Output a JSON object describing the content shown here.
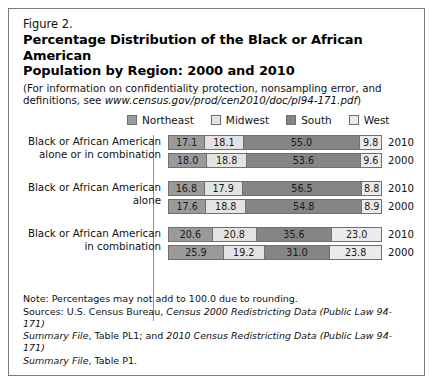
{
  "figure": {
    "number": "Figure 2.",
    "title_line1": "Percentage Distribution of the Black or African American",
    "title_line2": "Population by Region: 2000 and 2010",
    "subtitle_line1": "(For information on confidentiality protection, nonsampling error, and",
    "subtitle_line2_prefix": "definitions, see ",
    "subtitle_url": "www.census.gov/prod/cen2010/doc/pl94-171.pdf",
    "subtitle_line2_suffix": ")"
  },
  "legend": {
    "items": [
      {
        "label": "Northeast",
        "color": "#9a9a9a"
      },
      {
        "label": "Midwest",
        "color": "#e3e3e3"
      },
      {
        "label": "South",
        "color": "#858585"
      },
      {
        "label": "West",
        "color": "#ebebeb"
      }
    ]
  },
  "groups": [
    {
      "label_line1": "Black or African American",
      "label_line2": "alone or in combination",
      "rows": [
        {
          "year": "2010",
          "values": [
            "17.1",
            "18.1",
            "55.0",
            "9.8"
          ]
        },
        {
          "year": "2000",
          "values": [
            "18.0",
            "18.8",
            "53.6",
            "9.6"
          ]
        }
      ]
    },
    {
      "label_line1": "Black or African American",
      "label_line2": "alone",
      "rows": [
        {
          "year": "2010",
          "values": [
            "16.8",
            "17.9",
            "56.5",
            "8.8"
          ]
        },
        {
          "year": "2000",
          "values": [
            "17.6",
            "18.8",
            "54.8",
            "8.9"
          ]
        }
      ]
    },
    {
      "label_line1": "Black or African American",
      "label_line2": "in combination",
      "rows": [
        {
          "year": "2010",
          "values": [
            "20.6",
            "20.8",
            "35.6",
            "23.0"
          ]
        },
        {
          "year": "2000",
          "values": [
            "25.9",
            "19.2",
            "31.0",
            "23.8"
          ]
        }
      ]
    }
  ],
  "footer": {
    "note": "Note: Percentages may not add to 100.0 due to rounding.",
    "sources_prefix": "Sources: U.S. Census Bureau, ",
    "sources_ital1": "Census 2000 Redistricting Data (Public Law 94-171)",
    "sources_ital2": "Summary File",
    "sources_mid": ", Table PL1; and ",
    "sources_ital3": "2010 Census Redistricting Data (Public Law 94-171)",
    "sources_ital4": "Summary File",
    "sources_end": ", Table P1."
  },
  "chart_data": {
    "type": "bar",
    "title": "Percentage Distribution of the Black or African American Population by Region: 2000 and 2010",
    "subtitle": "(For information on confidentiality protection, nonsampling error, and definitions, see www.census.gov/prod/cen2010/doc/pl94-171.pdf)",
    "orientation": "horizontal",
    "stacked": true,
    "stacked_normalized": true,
    "xlabel": "",
    "ylabel": "",
    "xlim": [
      0,
      100
    ],
    "grid": false,
    "legend_position": "top-center",
    "legend": [
      "Northeast",
      "Midwest",
      "South",
      "West"
    ],
    "categories": [
      "Black or African American alone or in combination, 2010",
      "Black or African American alone or in combination, 2000",
      "Black or African American alone, 2010",
      "Black or African American alone, 2000",
      "Black or African American in combination, 2010",
      "Black or African American in combination, 2000"
    ],
    "series": [
      {
        "name": "Northeast",
        "values": [
          17.1,
          18.0,
          16.8,
          17.6,
          20.6,
          25.9
        ]
      },
      {
        "name": "Midwest",
        "values": [
          18.1,
          18.8,
          17.9,
          18.8,
          20.8,
          19.2
        ]
      },
      {
        "name": "South",
        "values": [
          55.0,
          53.6,
          56.5,
          54.8,
          35.6,
          31.0
        ]
      },
      {
        "name": "West",
        "values": [
          9.8,
          9.6,
          8.8,
          8.9,
          23.0,
          23.8
        ]
      }
    ],
    "note": "Note: Percentages may not add to 100.0 due to rounding.",
    "source": "Sources: U.S. Census Bureau, Census 2000 Redistricting Data (Public Law 94-171) Summary File, Table PL1; and 2010 Census Redistricting Data (Public Law 94-171) Summary File, Table P1."
  }
}
